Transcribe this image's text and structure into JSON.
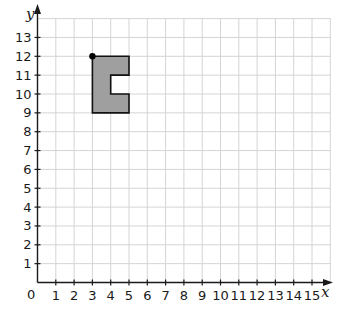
{
  "diagram": {
    "type": "coordinate-grid",
    "x_axis": {
      "label": "x",
      "min": 0,
      "max": 15,
      "grid_max": 16,
      "ticks": [
        "1",
        "2",
        "3",
        "4",
        "5",
        "6",
        "7",
        "8",
        "9",
        "10",
        "11",
        "12",
        "13",
        "14",
        "15"
      ]
    },
    "y_axis": {
      "label": "y",
      "min": 0,
      "max": 13,
      "grid_max": 14,
      "ticks": [
        "1",
        "2",
        "3",
        "4",
        "5",
        "6",
        "7",
        "8",
        "9",
        "10",
        "11",
        "12",
        "13"
      ]
    },
    "origin_label": "0",
    "shape": {
      "name": "C-shape",
      "vertices": [
        [
          3,
          12
        ],
        [
          5,
          12
        ],
        [
          5,
          11
        ],
        [
          4,
          11
        ],
        [
          4,
          10
        ],
        [
          5,
          10
        ],
        [
          5,
          9
        ],
        [
          3,
          9
        ]
      ],
      "fill": "#9a9a9a",
      "stroke": "#111111"
    },
    "marked_point": {
      "coords": [
        3,
        12
      ]
    },
    "colors": {
      "grid": "#d4d4d4",
      "axis": "#1a1a1a"
    }
  }
}
